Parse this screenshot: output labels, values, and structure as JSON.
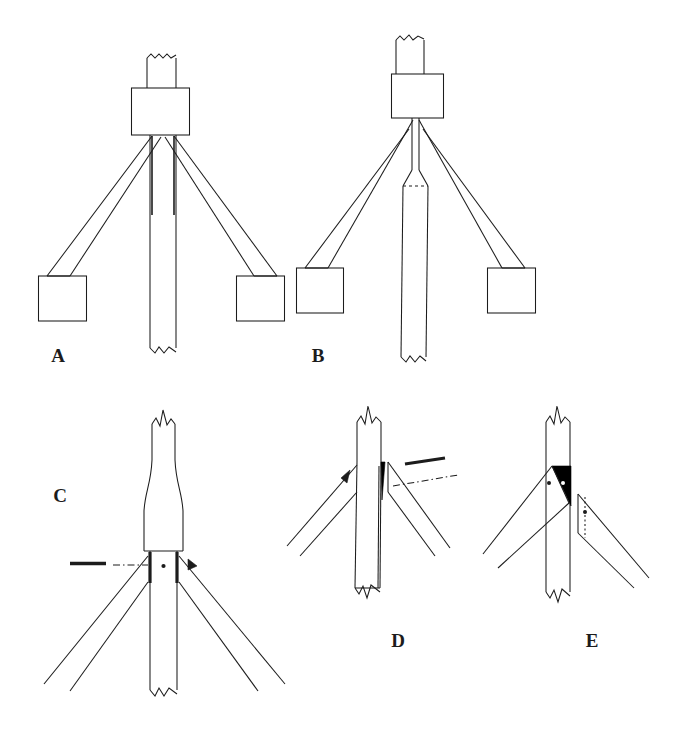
{
  "figure": {
    "type": "technical-line-drawing",
    "background_color": "#ffffff",
    "line_color": "#1c1c1c",
    "fill_color": "#000000",
    "panels": [
      {
        "id": "A",
        "label": "A",
        "label_x": 58,
        "label_y": 362,
        "caption": "Complete assembly, front view: capped head block, central shaft and two splayed legs ending in rectangular feet.",
        "parts": [
          "broken-top-shaft",
          "head-block",
          "central-shaft",
          "left-leg",
          "right-leg",
          "left-foot-box",
          "right-foot-box"
        ]
      },
      {
        "id": "B",
        "label": "B",
        "label_x": 318,
        "label_y": 362,
        "caption": "Same assembly with the central shaft enlarged below a dashed transition line; legs meet the feet at a lower angle.",
        "parts": [
          "broken-top-shaft",
          "head-block",
          "tapered-shaft",
          "dashed-transition-line",
          "central-shaft",
          "left-leg",
          "right-leg",
          "left-foot-box",
          "right-foot-box"
        ]
      },
      {
        "id": "C",
        "label": "C",
        "label_x": 60,
        "label_y": 502,
        "caption": "Enlarged joint detail: flared shaft collar with dark side plates, centre pivot dot, dash-dot axis and pointer arrow.",
        "parts": [
          "broken-shaft-top",
          "flared-collar",
          "dark-side-plate-left",
          "dark-side-plate-right",
          "pivot-dot",
          "dash-dot-leader",
          "pointer-arrow",
          "left-leg",
          "right-leg",
          "broken-shaft-bottom"
        ]
      },
      {
        "id": "D",
        "label": "D",
        "label_x": 398,
        "label_y": 647,
        "caption": "Joint detail with a solid black wedge gusset on the right face of the shaft; small arrowhead marks the left leg seat and a dash-dot leader marks the right.",
        "parts": [
          "broken-shaft-top",
          "central-shaft",
          "black-wedge-gusset",
          "arrowhead-marker",
          "leader-bar",
          "dash-dot-leader",
          "left-leg",
          "right-leg",
          "broken-shaft-bottom"
        ]
      },
      {
        "id": "E",
        "label": "E",
        "label_x": 592,
        "label_y": 647,
        "caption": "Joint detail with a solid black triangular bracket carrying two pale fixing dots; the right leg is shown detached with its own fixing dot and dotted alignment line.",
        "parts": [
          "broken-shaft-top",
          "central-shaft",
          "black-triangular-bracket",
          "bracket-dot-left",
          "bracket-dot-right",
          "left-leg-attached",
          "right-leg-detached",
          "detached-leg-dot",
          "dotted-alignment-line",
          "broken-shaft-bottom"
        ]
      }
    ]
  }
}
